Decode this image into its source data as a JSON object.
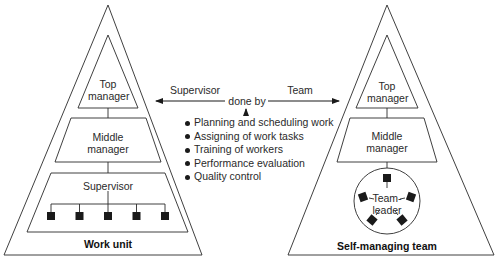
{
  "diagram": {
    "left_pyramid": {
      "title": "Work unit",
      "levels": {
        "top": "Top\nmanager",
        "top_line1": "Top",
        "top_line2": "manager",
        "middle_line1": "Middle",
        "middle_line2": "manager",
        "supervisor": "Supervisor"
      },
      "worker_count": 5
    },
    "right_pyramid": {
      "title": "Self-managing team",
      "levels": {
        "top_line1": "Top",
        "top_line2": "manager",
        "middle_line1": "Middle",
        "middle_line2": "manager",
        "team_leader_line1": "Team-",
        "team_leader_line2": "leader"
      },
      "member_count": 5
    },
    "center": {
      "left_arrow_label": "Supervisor",
      "right_arrow_label": "Team",
      "connector_label": "done by",
      "tasks": [
        "Planning and scheduling work",
        "Assigning of work tasks",
        "Training of workers",
        "Performance evaluation",
        "Quality control"
      ]
    },
    "colors": {
      "stroke": "#2a2a2a",
      "fill": "#ffffff",
      "node": "#1a1a1a"
    }
  }
}
